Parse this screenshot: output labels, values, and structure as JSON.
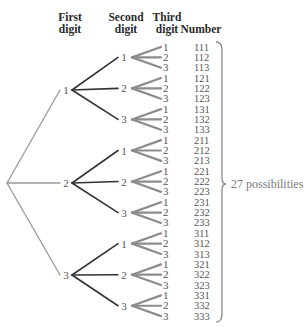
{
  "headers": {
    "first": {
      "line1": "First",
      "line2": "digit"
    },
    "second": {
      "line1": "Second",
      "line2": "digit"
    },
    "third": {
      "line1": "Third",
      "line2": "digit"
    },
    "number": {
      "line1": "Number"
    }
  },
  "digits": [
    "1",
    "2",
    "3"
  ],
  "numbers": [
    "111",
    "112",
    "113",
    "121",
    "122",
    "123",
    "131",
    "132",
    "133",
    "211",
    "212",
    "213",
    "221",
    "222",
    "223",
    "231",
    "232",
    "233",
    "311",
    "312",
    "313",
    "321",
    "322",
    "323",
    "331",
    "332",
    "333"
  ],
  "summary": "27 possibilities",
  "colors": {
    "level1_line": "#9a9a9a",
    "level2_line": "#333333",
    "level3_line": "#8c8c8c",
    "text": "#555555",
    "brace": "#8a8a8a"
  },
  "layout": {
    "root": {
      "x": 7,
      "y": 183
    },
    "level1_x": 66,
    "level1_ys": [
      90,
      183,
      275
    ],
    "level2_x": 124,
    "level3_line_start_x": 132,
    "level3_line_end_x": 161,
    "level3_label_x": 163,
    "number_x": 194,
    "row0_y": 47,
    "row_step": 10.35
  }
}
